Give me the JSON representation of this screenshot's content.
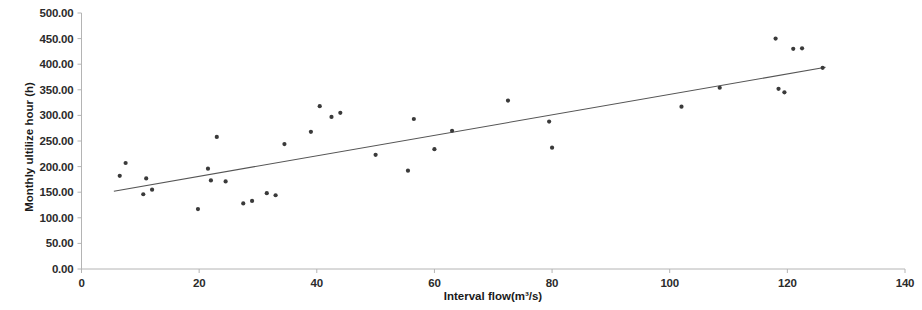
{
  "chart_data": {
    "type": "scatter",
    "title": "",
    "xlabel": "Interval flow(m³/s)",
    "ylabel": "Monthly ultilize hour (h)",
    "xlim": [
      0,
      140
    ],
    "ylim": [
      0,
      500
    ],
    "xticks": [
      0,
      20,
      40,
      60,
      80,
      100,
      120,
      140
    ],
    "yticks": [
      0,
      50,
      100,
      150,
      200,
      250,
      300,
      350,
      400,
      450,
      500
    ],
    "xtick_labels": [
      "0",
      "20",
      "40",
      "60",
      "80",
      "100",
      "120",
      "140"
    ],
    "ytick_labels": [
      "0.00",
      "50.00",
      "100.00",
      "150.00",
      "200.00",
      "250.00",
      "300.00",
      "350.00",
      "400.00",
      "450.00",
      "500.00"
    ],
    "grid": false,
    "legend": null,
    "marker_color": "#3a3a3a",
    "trendline_color": "#555555",
    "axis_color": "#b4b4b4",
    "points": [
      {
        "x": 6.5,
        "y": 182
      },
      {
        "x": 7.5,
        "y": 207
      },
      {
        "x": 10.5,
        "y": 146
      },
      {
        "x": 11.0,
        "y": 177
      },
      {
        "x": 12.0,
        "y": 155
      },
      {
        "x": 19.8,
        "y": 117
      },
      {
        "x": 21.5,
        "y": 196
      },
      {
        "x": 22.0,
        "y": 173
      },
      {
        "x": 23.0,
        "y": 258
      },
      {
        "x": 24.5,
        "y": 171
      },
      {
        "x": 27.5,
        "y": 128
      },
      {
        "x": 29.0,
        "y": 133
      },
      {
        "x": 31.5,
        "y": 148
      },
      {
        "x": 33.0,
        "y": 144
      },
      {
        "x": 34.5,
        "y": 244
      },
      {
        "x": 39.0,
        "y": 268
      },
      {
        "x": 40.5,
        "y": 318
      },
      {
        "x": 42.5,
        "y": 297
      },
      {
        "x": 44.0,
        "y": 305
      },
      {
        "x": 50.0,
        "y": 223
      },
      {
        "x": 55.5,
        "y": 192
      },
      {
        "x": 56.5,
        "y": 293
      },
      {
        "x": 60.0,
        "y": 234
      },
      {
        "x": 63.0,
        "y": 270
      },
      {
        "x": 72.5,
        "y": 329
      },
      {
        "x": 79.5,
        "y": 288
      },
      {
        "x": 80.0,
        "y": 237
      },
      {
        "x": 102.0,
        "y": 317
      },
      {
        "x": 108.5,
        "y": 354
      },
      {
        "x": 118.0,
        "y": 450
      },
      {
        "x": 118.5,
        "y": 352
      },
      {
        "x": 119.5,
        "y": 345
      },
      {
        "x": 121.0,
        "y": 430
      },
      {
        "x": 122.5,
        "y": 431
      },
      {
        "x": 126.0,
        "y": 393
      }
    ],
    "trendline": {
      "x0": 5.5,
      "y0": 152,
      "x1": 126.5,
      "y1": 394
    }
  }
}
